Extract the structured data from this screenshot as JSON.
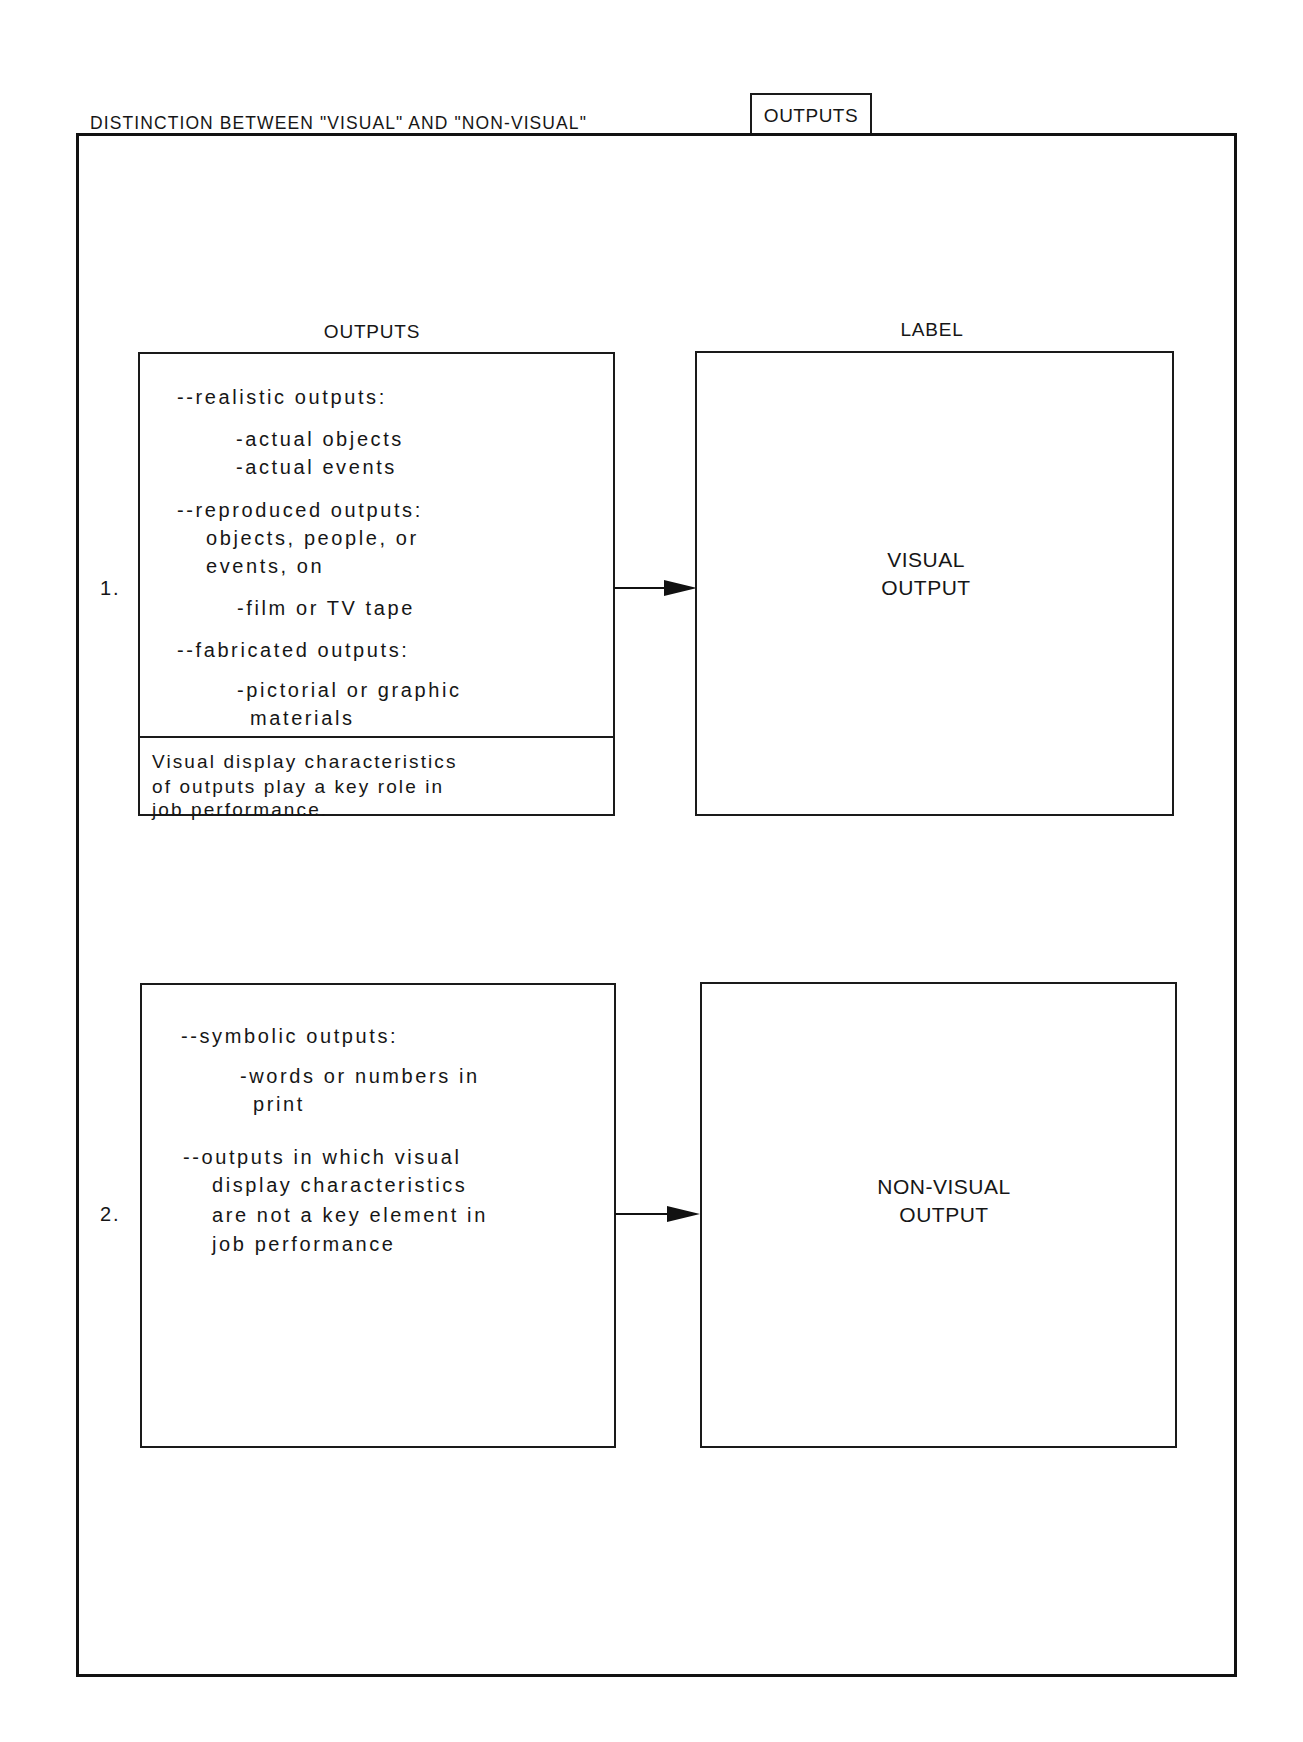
{
  "header": {
    "title": "DISTINCTION BETWEEN \"VISUAL\" AND \"NON-VISUAL\"",
    "tab_label": "OUTPUTS"
  },
  "columns": {
    "left_heading": "OUTPUTS",
    "right_heading": "LABEL"
  },
  "rows": [
    {
      "number": "1.",
      "output_lines": [
        "--realistic outputs:",
        "-actual objects",
        "-actual events",
        "--reproduced outputs:",
        "objects, people, or",
        "events, on",
        "-film or TV tape",
        "--fabricated outputs:",
        "-pictorial or graphic",
        "materials"
      ],
      "caption_lines": [
        "Visual display characteristics",
        "of outputs play a key role in",
        "job performance."
      ],
      "label_lines": [
        "VISUAL",
        "OUTPUT"
      ]
    },
    {
      "number": "2.",
      "output_lines": [
        "--symbolic outputs:",
        "-words or numbers in",
        "print",
        "--outputs in which visual",
        "display characteristics",
        "are not a key element in",
        "job performance"
      ],
      "label_lines": [
        "NON-VISUAL",
        "OUTPUT"
      ]
    }
  ],
  "colors": {
    "ink": "#161616",
    "paper": "#ffffff"
  }
}
